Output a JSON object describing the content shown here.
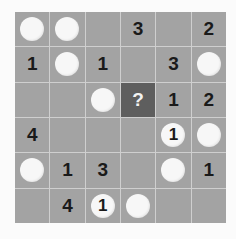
{
  "puzzle": {
    "rows": 6,
    "cols": 6,
    "colors": {
      "cell": "#a3a3a3",
      "highlight": "#5e5e5e",
      "circle": "#f7f7f7",
      "gridline": "#cfcfcf"
    },
    "cells": [
      [
        {
          "type": "circle",
          "text": ""
        },
        {
          "type": "circle",
          "text": ""
        },
        {
          "type": "empty",
          "text": ""
        },
        {
          "type": "number",
          "text": "3"
        },
        {
          "type": "empty",
          "text": ""
        },
        {
          "type": "number",
          "text": "2"
        }
      ],
      [
        {
          "type": "number",
          "text": "1"
        },
        {
          "type": "circle",
          "text": ""
        },
        {
          "type": "number",
          "text": "1"
        },
        {
          "type": "empty",
          "text": ""
        },
        {
          "type": "number",
          "text": "3"
        },
        {
          "type": "circle",
          "text": ""
        }
      ],
      [
        {
          "type": "empty",
          "text": ""
        },
        {
          "type": "empty",
          "text": ""
        },
        {
          "type": "circle",
          "text": ""
        },
        {
          "type": "question",
          "text": "?"
        },
        {
          "type": "number",
          "text": "1"
        },
        {
          "type": "number",
          "text": "2"
        }
      ],
      [
        {
          "type": "number",
          "text": "4"
        },
        {
          "type": "empty",
          "text": ""
        },
        {
          "type": "empty",
          "text": ""
        },
        {
          "type": "empty",
          "text": ""
        },
        {
          "type": "circle",
          "text": "1"
        },
        {
          "type": "circle",
          "text": ""
        }
      ],
      [
        {
          "type": "circle",
          "text": ""
        },
        {
          "type": "number",
          "text": "1"
        },
        {
          "type": "number",
          "text": "3"
        },
        {
          "type": "empty",
          "text": ""
        },
        {
          "type": "circle",
          "text": ""
        },
        {
          "type": "number",
          "text": "1"
        }
      ],
      [
        {
          "type": "empty",
          "text": ""
        },
        {
          "type": "number",
          "text": "4"
        },
        {
          "type": "circle",
          "text": "1"
        },
        {
          "type": "circle",
          "text": ""
        },
        {
          "type": "empty",
          "text": ""
        },
        {
          "type": "empty",
          "text": ""
        }
      ]
    ]
  }
}
